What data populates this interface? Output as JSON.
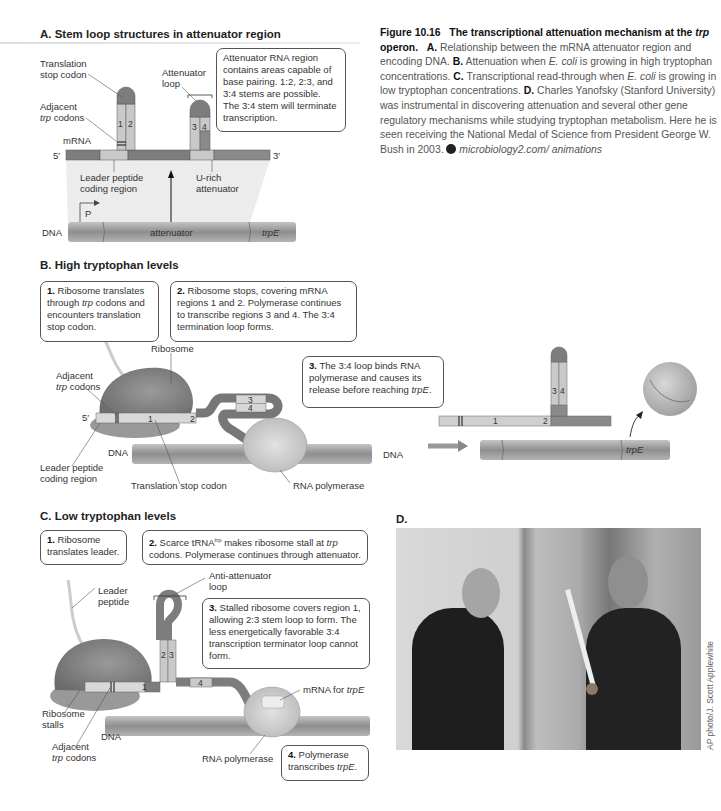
{
  "panelA": {
    "heading": "A. Stem loop structures in attenuator region",
    "labels": {
      "translation_stop_1": "Translation",
      "translation_stop_2": "stop codon",
      "adjacent_1": "Adjacent",
      "adjacent_2_it": "trp",
      "adjacent_2": " codons",
      "mrna": "mRNA",
      "five_prime": "5′",
      "three_prime": "3′",
      "attenuator_loop_1": "Attenuator",
      "attenuator_loop_2": "loop",
      "leader_1": "Leader peptide",
      "leader_2": "coding region",
      "urich_1": "U-rich",
      "urich_2": "attenuator",
      "promoter": "P",
      "dna": "DNA",
      "attenuator": "attenuator",
      "trpE": "trpE",
      "stem1": "1",
      "stem2": "2",
      "stem3": "3",
      "stem4": "4"
    },
    "callout": "Attenuator RNA region contains areas capable of base pairing. 1:2, 2:3, and 3:4 stems are possible. The 3:4 stem will terminate transcription."
  },
  "caption": {
    "figure_no": "Figure 10.16",
    "title_a": "The transcriptional attenuation mechanism at the ",
    "title_it": "trp",
    "title_b": " operon.",
    "a_lbl": "A.",
    "a_txt": " Relationship between the mRNA attenuator region and encoding DNA. ",
    "b_lbl": "B.",
    "b_txt1": " Attenuation when ",
    "b_it": "E. coli",
    "b_txt2": " is growing in high tryptophan concentrations. ",
    "c_lbl": "C.",
    "c_txt1": " Transcriptional read-through when ",
    "c_it": "E. coli",
    "c_txt2": " is growing in low tryptophan concentrations. ",
    "d_lbl": "D.",
    "d_txt": " Charles Yanofsky (Stanford University) was instrumental in discovering attenuation and several other gene regulatory mechanisms while studying tryptophan metabolism. Here he is seen receiving the National Medal of Science from President George W. Bush in 2003. ",
    "link": "microbiology2.com/ animations"
  },
  "panelB": {
    "heading": "B. High tryptophan levels",
    "step1_num": "1.",
    "step1_a": " Ribosome translates through ",
    "step1_it": "trp",
    "step1_b": " codons and encounters translation stop codon.",
    "step2_num": "2.",
    "step2": " Ribosome stops, covering mRNA regions 1 and 2. Polymerase continues to transcribe regions 3 and 4. The 3:4 termination loop forms.",
    "step3_num": "3.",
    "step3_a": " The 3:4 loop binds RNA polymerase and causes its release before reaching ",
    "step3_it": "trpE",
    "step3_b": ".",
    "labels": {
      "ribosome": "Ribosome",
      "adjacent_1": "Adjacent",
      "adjacent_2_it": "trp",
      "adjacent_2": " codons",
      "five_prime": "5′",
      "dna": "DNA",
      "dna2": "DNA",
      "leader_1": "Leader peptide",
      "leader_2": "coding region",
      "stop_codon": "Translation stop codon",
      "rna_pol": "RNA polymerase",
      "trpE": "trpE",
      "r1": "1",
      "r2": "2",
      "r3": "3",
      "r4": "4"
    }
  },
  "panelC": {
    "heading": "C. Low tryptophan levels",
    "step1_num": "1.",
    "step1": " Ribosome translates leader.",
    "step2_num": "2.",
    "step2_a": " Scarce tRNA",
    "step2_sup": "trp",
    "step2_b": " makes ribosome stall at ",
    "step2_it": "trp",
    "step2_c": " codons. Polymerase continues through attenuator.",
    "step3_num": "3.",
    "step3": " Stalled ribosome covers region 1, allowing 2:3 stem loop to form. The less energetically favorable 3:4 transcription terminator loop cannot form.",
    "step4_num": "4.",
    "step4_a": " Polymerase transcribes ",
    "step4_it": "trpE",
    "step4_b": ".",
    "labels": {
      "anti_1": "Anti-attenuator",
      "anti_2": "loop",
      "leader_1": "Leader",
      "leader_2": "peptide",
      "ribosome_1": "Ribosome",
      "ribosome_2": "stalls",
      "dna": "DNA",
      "adjacent_1": "Adjacent",
      "adjacent_2_it": "trp",
      "adjacent_2": " codons",
      "rna_pol": "RNA polymerase",
      "mrna_a": "mRNA for ",
      "mrna_it": "trpE",
      "r1": "1",
      "r2": "2",
      "r3": "3",
      "r4": "4"
    }
  },
  "panelD": {
    "heading": "D.",
    "photo_alt": "Charles Yanofsky receiving the National Medal of Science from President George W. Bush",
    "credit": "AP photo/J. Scott Applewhite"
  },
  "colors": {
    "dark_segment": "#7d7d7d",
    "light_segment": "#c9c9c9",
    "mid_segment": "#a3a3a3",
    "dna": "#9a9a9a",
    "ribosome": "#8a8a8a"
  }
}
